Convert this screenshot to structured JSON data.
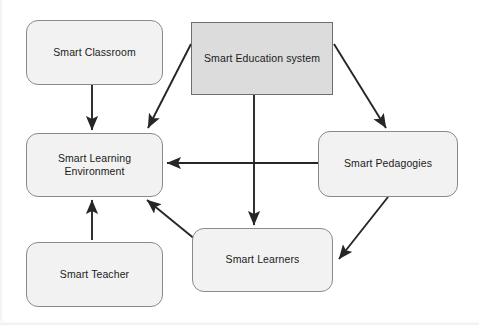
{
  "diagram": {
    "background_color": "#ffffff",
    "node_fill": "#f2f2f2",
    "root_node_fill": "#dcdcdc",
    "border_color": "#8a8a8a",
    "arrow_color": "#262626",
    "nodes": [
      {
        "id": "smart-classroom",
        "label": "Smart Classroom",
        "shape": "rounded-rectangle",
        "x": 26,
        "y": 20,
        "w": 137,
        "h": 65
      },
      {
        "id": "smart-education-system",
        "label": "Smart Education  system",
        "shape": "rectangle",
        "x": 191,
        "y": 22,
        "w": 142,
        "h": 73
      },
      {
        "id": "smart-learning-environment",
        "label": "Smart Learning\nEnvironment",
        "shape": "rounded-rectangle",
        "x": 26,
        "y": 133,
        "w": 137,
        "h": 64
      },
      {
        "id": "smart-pedagogies",
        "label": "Smart Pedagogies",
        "shape": "rounded-rectangle",
        "x": 318,
        "y": 131,
        "w": 140,
        "h": 66
      },
      {
        "id": "smart-learners",
        "label": "Smart Learners",
        "shape": "rounded-rectangle",
        "x": 192,
        "y": 228,
        "w": 141,
        "h": 64
      },
      {
        "id": "smart-teacher",
        "label": "Smart Teacher",
        "shape": "rounded-rectangle",
        "x": 26,
        "y": 242,
        "w": 137,
        "h": 65
      }
    ],
    "edges": [
      {
        "id": "classroom-to-environment",
        "from": "smart-classroom",
        "to": "smart-learning-environment",
        "style": "straight-arrow"
      },
      {
        "id": "education-to-environment",
        "from": "smart-education-system",
        "to": "smart-learning-environment",
        "style": "diagonal-arrow"
      },
      {
        "id": "education-to-pedagogies",
        "from": "smart-education-system",
        "to": "smart-pedagogies",
        "style": "diagonal-arrow"
      },
      {
        "id": "education-to-learners",
        "from": "smart-education-system",
        "to": "smart-learners",
        "style": "straight-arrow"
      },
      {
        "id": "pedagogies-to-environment",
        "from": "smart-pedagogies",
        "to": "smart-learning-environment",
        "style": "straight-arrow"
      },
      {
        "id": "pedagogies-to-learners",
        "from": "smart-pedagogies",
        "to": "smart-learners",
        "style": "diagonal-arrow"
      },
      {
        "id": "learners-to-environment",
        "from": "smart-learners",
        "to": "smart-learning-environment",
        "style": "diagonal-arrow"
      },
      {
        "id": "teacher-to-environment",
        "from": "smart-teacher",
        "to": "smart-learning-environment",
        "style": "straight-arrow"
      }
    ]
  }
}
